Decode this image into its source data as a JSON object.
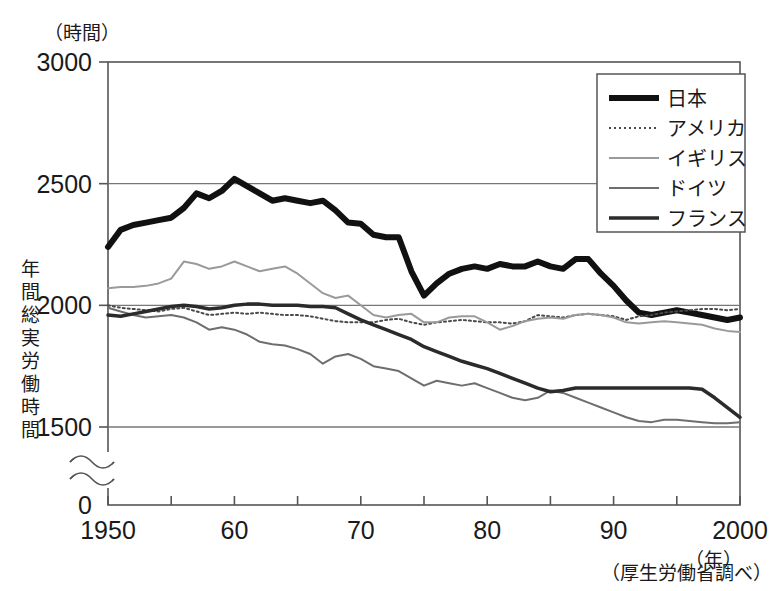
{
  "meta": {
    "top_cut_text": "",
    "y_unit_label": "（時間）",
    "x_unit_label": "（年）",
    "source_note": "（厚生労働省調べ）",
    "y_axis_title": "年間総実労働時間",
    "y_axis_title_chars": [
      "年",
      "間",
      "総",
      "実",
      "労",
      "働",
      "時",
      "間"
    ],
    "zero_label": "0"
  },
  "chart_data": {
    "type": "line",
    "title": "",
    "subtitle": "",
    "xlabel": "（年）",
    "ylabel": "年間総実労働時間（時間）",
    "xlim": [
      1950,
      2000
    ],
    "ylim": [
      1400,
      3000
    ],
    "y_ticks": [
      3000,
      2500,
      2000,
      1500
    ],
    "y_tick_labels": [
      "3000",
      "2500",
      "2000",
      "1500"
    ],
    "y_axis_break": true,
    "y_break_note": "axis broken between 1500 and 0",
    "x_ticks": [
      1950,
      1955,
      1960,
      1965,
      1970,
      1975,
      1980,
      1985,
      1990,
      1995,
      2000
    ],
    "x_tick_labels": [
      "1950",
      "",
      "60",
      "",
      "70",
      "",
      "80",
      "",
      "90",
      "",
      "2000"
    ],
    "x_major_labels": [
      "1950",
      "60",
      "70",
      "80",
      "90",
      "2000"
    ],
    "grid": "horizontal",
    "legend_position": "top-right",
    "source": "（厚生労働省調べ）",
    "x": [
      1950,
      1951,
      1952,
      1953,
      1954,
      1955,
      1956,
      1957,
      1958,
      1959,
      1960,
      1961,
      1962,
      1963,
      1964,
      1965,
      1966,
      1967,
      1968,
      1969,
      1970,
      1971,
      1972,
      1973,
      1974,
      1975,
      1976,
      1977,
      1978,
      1979,
      1980,
      1981,
      1982,
      1983,
      1984,
      1985,
      1986,
      1987,
      1988,
      1989,
      1990,
      1991,
      1992,
      1993,
      1994,
      1995,
      1996,
      1997,
      1998,
      1999,
      2000
    ],
    "series": [
      {
        "name": "日本",
        "label": "日本",
        "style": "thick-solid",
        "color": "#111111",
        "width": 6,
        "dash": "",
        "values": [
          2240,
          2310,
          2330,
          2340,
          2350,
          2360,
          2400,
          2460,
          2440,
          2470,
          2520,
          2490,
          2460,
          2430,
          2440,
          2430,
          2420,
          2430,
          2390,
          2340,
          2335,
          2290,
          2280,
          2280,
          2140,
          2040,
          2090,
          2130,
          2150,
          2160,
          2150,
          2170,
          2160,
          2160,
          2180,
          2160,
          2150,
          2190,
          2190,
          2130,
          2080,
          2020,
          1970,
          1960,
          1970,
          1980,
          1970,
          1960,
          1950,
          1940,
          1950
        ]
      },
      {
        "name": "アメリカ",
        "label": "アメリカ",
        "style": "dotted",
        "color": "#4a4a4a",
        "width": 2,
        "dash": "2 3",
        "values": [
          2000,
          1990,
          1985,
          1980,
          1975,
          1985,
          1990,
          1975,
          1960,
          1965,
          1970,
          1965,
          1970,
          1965,
          1960,
          1960,
          1955,
          1945,
          1935,
          1930,
          1930,
          1930,
          1940,
          1945,
          1930,
          1920,
          1930,
          1935,
          1940,
          1935,
          1930,
          1930,
          1925,
          1935,
          1960,
          1955,
          1950,
          1960,
          1965,
          1960,
          1955,
          1940,
          1955,
          1960,
          1970,
          1975,
          1980,
          1985,
          1985,
          1980,
          1985
        ]
      },
      {
        "name": "イギリス",
        "label": "イギリス",
        "style": "thin-light",
        "color": "#9a9a9a",
        "width": 2,
        "dash": "",
        "values": [
          2070,
          2075,
          2075,
          2080,
          2090,
          2110,
          2180,
          2170,
          2150,
          2160,
          2180,
          2160,
          2140,
          2150,
          2160,
          2130,
          2090,
          2050,
          2030,
          2040,
          2000,
          1960,
          1950,
          1960,
          1965,
          1930,
          1930,
          1950,
          1955,
          1955,
          1930,
          1900,
          1915,
          1935,
          1945,
          1950,
          1945,
          1960,
          1965,
          1960,
          1950,
          1930,
          1925,
          1930,
          1935,
          1930,
          1925,
          1920,
          1905,
          1895,
          1890
        ]
      },
      {
        "name": "ドイツ",
        "label": "ドイツ",
        "style": "thin-medium",
        "color": "#6e6e6e",
        "width": 2,
        "dash": "",
        "values": [
          1990,
          1975,
          1960,
          1950,
          1955,
          1960,
          1950,
          1930,
          1900,
          1910,
          1900,
          1880,
          1850,
          1840,
          1835,
          1820,
          1800,
          1760,
          1790,
          1800,
          1780,
          1750,
          1740,
          1730,
          1700,
          1670,
          1690,
          1680,
          1670,
          1680,
          1660,
          1640,
          1620,
          1610,
          1620,
          1650,
          1640,
          1620,
          1600,
          1580,
          1560,
          1540,
          1525,
          1520,
          1530,
          1530,
          1525,
          1520,
          1515,
          1515,
          1520
        ]
      },
      {
        "name": "フランス",
        "label": "フランス",
        "style": "medium-solid",
        "color": "#2b2b2b",
        "width": 3.5,
        "dash": "",
        "values": [
          1960,
          1955,
          1965,
          1975,
          1985,
          1995,
          2000,
          1995,
          1985,
          1990,
          2000,
          2005,
          2005,
          2000,
          2000,
          2000,
          1995,
          1995,
          1990,
          1965,
          1940,
          1920,
          1900,
          1880,
          1860,
          1830,
          1810,
          1790,
          1770,
          1755,
          1740,
          1720,
          1700,
          1680,
          1660,
          1645,
          1650,
          1660,
          1660,
          1660,
          1660,
          1660,
          1660,
          1660,
          1660,
          1660,
          1660,
          1655,
          1620,
          1580,
          1540
        ]
      }
    ]
  },
  "legend": {
    "items": [
      {
        "label": "日本"
      },
      {
        "label": "アメリカ"
      },
      {
        "label": "イギリス"
      },
      {
        "label": "ドイツ"
      },
      {
        "label": "フランス"
      }
    ]
  }
}
